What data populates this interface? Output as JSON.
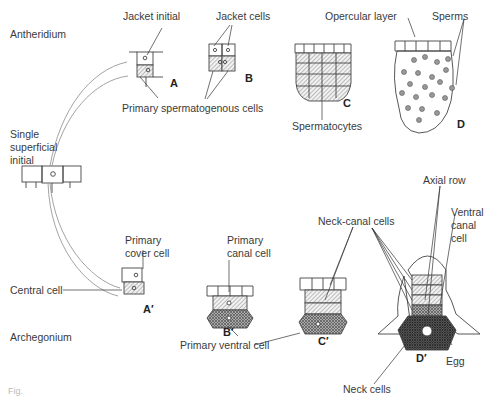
{
  "sections": {
    "antheridium": "Antheridium",
    "archegonium": "Archegonium"
  },
  "labels": {
    "single_initial_1": "Single",
    "single_initial_2": "superficial",
    "single_initial_3": "initial",
    "jacket_initial": "Jacket initial",
    "jacket_cells": "Jacket cells",
    "primary_spermatogenous": "Primary spermatogenous cells",
    "opercular_layer": "Opercular layer",
    "sperms": "Sperms",
    "spermatocytes": "Spermatocytes",
    "primary_cover_1": "Primary",
    "primary_cover_2": "cover cell",
    "central_cell": "Central cell",
    "primary_canal_1": "Primary",
    "primary_canal_2": "canal cell",
    "primary_ventral": "Primary ventral cell",
    "neck_canal_cells": "Neck-canal cells",
    "axial_row": "Axial row",
    "ventral_canal_1": "Ventral",
    "ventral_canal_2": "canal",
    "ventral_canal_3": "cell",
    "egg": "Egg",
    "neck_cells": "Neck cells"
  },
  "stage_letters": {
    "A": "A",
    "B": "B",
    "C": "C",
    "D": "D",
    "A_prime": "A′",
    "B_prime": "B′",
    "C_prime": "C′",
    "D_prime": "D′"
  },
  "caption": "Fig."
}
